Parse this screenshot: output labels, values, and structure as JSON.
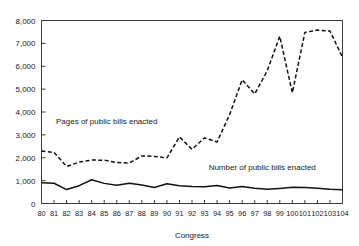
{
  "chart_data": {
    "type": "line",
    "title": "",
    "xlabel": "Congress",
    "ylabel": "",
    "grid": false,
    "legend_position": "inline-annotation",
    "xlim": [
      80,
      104
    ],
    "ylim": [
      0,
      8000
    ],
    "ytick_labels": [
      "8,000",
      "7,000",
      "6,000",
      "5,000",
      "4,000",
      "3,000",
      "2,000",
      "1,000",
      "0"
    ],
    "ytick_values": [
      8000,
      7000,
      6000,
      5000,
      4000,
      3000,
      2000,
      1000,
      0
    ],
    "categories": [
      "80",
      "81",
      "82",
      "83",
      "84",
      "85",
      "86",
      "87",
      "88",
      "89",
      "90",
      "91",
      "92",
      "93",
      "94",
      "95",
      "96",
      "97",
      "98",
      "99",
      "100",
      "101",
      "102",
      "103",
      "104"
    ],
    "x": [
      80,
      81,
      82,
      83,
      84,
      85,
      86,
      87,
      88,
      89,
      90,
      91,
      92,
      93,
      94,
      95,
      96,
      97,
      98,
      99,
      100,
      101,
      102,
      103,
      104
    ],
    "series": [
      {
        "name": "Pages of public bills enacted",
        "style": "dashed",
        "values": [
          2300,
          2230,
          1620,
          1810,
          1900,
          1890,
          1790,
          1770,
          2080,
          2060,
          1990,
          2910,
          2370,
          2870,
          2690,
          3890,
          5410,
          4790,
          5800,
          7310,
          4840,
          7480,
          7580,
          7540,
          6390
        ]
      },
      {
        "name": "Number of public bills enacted",
        "style": "solid",
        "values": [
          905,
          885,
          610,
          780,
          1040,
          880,
          800,
          885,
          810,
          700,
          860,
          780,
          740,
          730,
          790,
          680,
          740,
          670,
          620,
          660,
          710,
          700,
          670,
          620,
          600
        ]
      }
    ],
    "annotations": [
      {
        "text": "Pages of public bills enacted",
        "x": 85.2,
        "y": 3480
      },
      {
        "text": "Number of public bills enacted",
        "x": 97.6,
        "y": 1450
      }
    ],
    "colors": {
      "line": "#111111",
      "axis": "#3a3a3a",
      "text": "#1a1a1a",
      "background": "#ffffff"
    }
  }
}
